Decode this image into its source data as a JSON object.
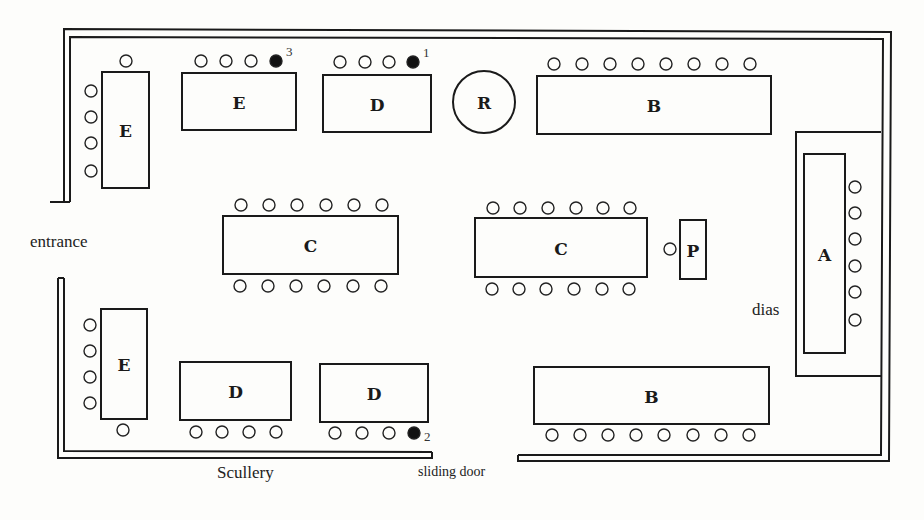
{
  "labels": {
    "entrance": "entrance",
    "scullery": "Scullery",
    "sliding_door": "sliding door",
    "dias": "dias"
  },
  "tables": [
    {
      "id": "E-left-top",
      "label": "E",
      "x": 102,
      "y": 72,
      "w": 47,
      "h": 116
    },
    {
      "id": "E-top",
      "label": "E",
      "x": 182,
      "y": 73,
      "w": 114,
      "h": 57
    },
    {
      "id": "D-top",
      "label": "D",
      "x": 323,
      "y": 75,
      "w": 108,
      "h": 57
    },
    {
      "id": "R",
      "label": "R",
      "shape": "circle",
      "cx": 484,
      "cy": 102,
      "r": 31
    },
    {
      "id": "B-top",
      "label": "B",
      "x": 537,
      "y": 76,
      "w": 234,
      "h": 58
    },
    {
      "id": "A",
      "label": "A",
      "x": 804,
      "y": 154,
      "w": 41,
      "h": 199
    },
    {
      "id": "C-left",
      "label": "C",
      "x": 223,
      "y": 216,
      "w": 175,
      "h": 58
    },
    {
      "id": "C-right",
      "label": "C",
      "x": 475,
      "y": 218,
      "w": 172,
      "h": 59
    },
    {
      "id": "P",
      "label": "P",
      "x": 680,
      "y": 220,
      "w": 26,
      "h": 59
    },
    {
      "id": "E-left-bottom",
      "label": "E",
      "x": 101,
      "y": 309,
      "w": 46,
      "h": 110
    },
    {
      "id": "D-bottom-left",
      "label": "D",
      "x": 180,
      "y": 362,
      "w": 111,
      "h": 58
    },
    {
      "id": "D-bottom-right",
      "label": "D",
      "x": 320,
      "y": 364,
      "w": 108,
      "h": 58
    },
    {
      "id": "B-bottom",
      "label": "B",
      "x": 534,
      "y": 367,
      "w": 235,
      "h": 57
    }
  ],
  "seat_rows": [
    {
      "near": "E-left-top",
      "xs": [
        126
      ],
      "y": 61
    },
    {
      "near": "E-left-top",
      "x": 91,
      "ys": [
        91,
        117,
        143,
        171
      ]
    },
    {
      "near": "E-top",
      "xs": [
        201,
        226,
        251
      ],
      "y": 61,
      "filled": {
        "x": 276,
        "y": 61,
        "number": "3"
      }
    },
    {
      "near": "D-top",
      "xs": [
        340,
        365,
        389
      ],
      "y": 62,
      "filled": {
        "x": 413,
        "y": 62,
        "number": "1"
      }
    },
    {
      "near": "B-top",
      "xs": [
        554,
        582,
        610,
        638,
        666,
        694,
        722,
        750
      ],
      "y": 64
    },
    {
      "near": "A",
      "x": 855,
      "ys": [
        187,
        213,
        239,
        266,
        292,
        320
      ]
    },
    {
      "near": "C-left",
      "xs": [
        241,
        269,
        297,
        326,
        354,
        382
      ],
      "y": 205
    },
    {
      "near": "C-left",
      "xs": [
        240,
        268,
        296,
        324,
        353,
        381
      ],
      "y": 286
    },
    {
      "near": "C-right",
      "xs": [
        493,
        520,
        548,
        576,
        603,
        630
      ],
      "y": 208
    },
    {
      "near": "C-right",
      "xs": [
        492,
        519,
        546,
        574,
        602,
        629
      ],
      "y": 289
    },
    {
      "near": "P",
      "xs": [
        670
      ],
      "y": 249
    },
    {
      "near": "E-left-bottom",
      "x": 90,
      "ys": [
        325,
        351,
        377,
        403
      ]
    },
    {
      "near": "E-left-bottom",
      "xs": [
        123
      ],
      "y": 430
    },
    {
      "near": "D-bottom-left",
      "xs": [
        196,
        222,
        249,
        276
      ],
      "y": 432
    },
    {
      "near": "D-bottom-right",
      "xs": [
        335,
        362,
        389
      ],
      "y": 433,
      "filled": {
        "x": 414,
        "y": 433,
        "number": "2"
      }
    },
    {
      "near": "B-bottom",
      "xs": [
        552,
        580,
        608,
        636,
        664,
        693,
        721,
        749
      ],
      "y": 435
    }
  ],
  "walls": {
    "top_outer": "M64,202 L64,29 L891,32 L889,461 L518,461 L518,455",
    "top_inner": "M70,202 L70,37 L883,39 L881,455 L518,455",
    "entrance_top_stub": "M50,202 L70,202",
    "bottom_outer": "M58,278 L58,458 L432,458 L432,452",
    "bottom_inner": "M64,278 L64,451 L432,452",
    "entrance_bottom_cap": "M58,278 L64,278",
    "dias_box": "M881,132 L796,132 L796,376 L881,376"
  },
  "numbers_colors": {
    "ink": "#1a1a1a",
    "paper": "#fdfdfb"
  }
}
